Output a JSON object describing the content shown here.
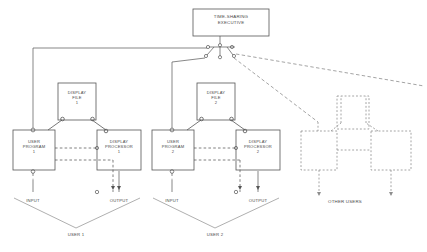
{
  "diagram": {
    "title_box": {
      "line1": "TIME-SHARING",
      "line2": "EXECUTIVE"
    },
    "users": [
      {
        "id": "user1",
        "caption": "USER 1",
        "program": {
          "line1": "USER",
          "line2": "PROGRAM",
          "line3": "1"
        },
        "file": {
          "line1": "DISPLAY",
          "line2": "FILE",
          "line3": "1"
        },
        "processor": {
          "line1": "DISPLAY",
          "line2": "PROCESSOR",
          "line3": "1"
        },
        "input_label": "INPUT",
        "output_label": "OUTPUT"
      },
      {
        "id": "user2",
        "caption": "USER 2",
        "program": {
          "line1": "USER",
          "line2": "PROGRAM",
          "line3": "2"
        },
        "file": {
          "line1": "DISPLAY",
          "line2": "FILE",
          "line3": "2"
        },
        "processor": {
          "line1": "DISPLAY",
          "line2": "PROCESSOR",
          "line3": "2"
        },
        "input_label": "INPUT",
        "output_label": "OUTPUT"
      }
    ],
    "other_users_label": "OTHER USERS",
    "colors": {
      "stroke": "#555555",
      "ghost_stroke": "#8d8d8d",
      "text": "#4a4a4a",
      "background": "#ffffff"
    }
  }
}
